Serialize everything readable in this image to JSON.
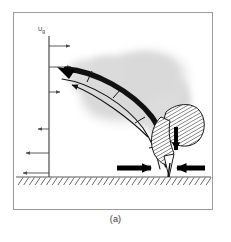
{
  "figure": {
    "caption": "(a)",
    "axis_label": "Ug",
    "axis_label_main": "U",
    "axis_label_sub": "g",
    "frame": {
      "x": 13,
      "y": 12,
      "width": 200,
      "height": 198,
      "border_color": "#9a9a9a"
    },
    "colors": {
      "background": "#ffffff",
      "frame_border": "#9a9a9a",
      "profile_line": "#4a4a4a",
      "profile_arrow": "#4a4a4a",
      "jet_band": "#111111",
      "plume": "#d4d4d4",
      "nozzle_hatch": "#1a1a1a",
      "nozzle_fill": "#ffffff",
      "ground_line": "#5a5a5a",
      "ground_hatch": "#5a5a5a",
      "bold_arrow": "#000000",
      "caption_text": "#3a3a3a"
    },
    "ground": {
      "y": 176,
      "x_start": 16,
      "x_end": 211,
      "hatch_count": 34,
      "hatch_length": 9,
      "hatch_angle_deg": 55
    },
    "velocity_profile": {
      "axis_x": 48,
      "axis_y_top": 35,
      "axis_y_bottom": 176,
      "label_x": 38,
      "label_y": 26,
      "arrows": [
        {
          "y": 45,
          "length": 22,
          "direction": "right"
        },
        {
          "y": 66,
          "length": 22,
          "direction": "right"
        },
        {
          "y": 91,
          "length": 12,
          "direction": "right"
        },
        {
          "y": 128,
          "length": 12,
          "direction": "left"
        },
        {
          "y": 152,
          "length": 24,
          "direction": "left"
        },
        {
          "y": 172,
          "length": 26,
          "direction": "left"
        }
      ]
    },
    "jet": {
      "description": "curved deflected jet band",
      "tip_x": 62,
      "tip_y": 66,
      "base_x": 160,
      "base_y": 168,
      "band_color": "#111111",
      "inner_arrow_direction": "up-left"
    },
    "plume": {
      "description": "fuzzy gray entrained plume cloud",
      "cx": 130,
      "cy": 82,
      "rx": 55,
      "ry": 36
    },
    "nozzle": {
      "description": "hatched burner nozzle bulb",
      "cx": 172,
      "cy": 125,
      "rx": 22,
      "ry": 20,
      "hatch_spacing": 3,
      "inner_arrow_direction": "down"
    },
    "ground_arrows": [
      {
        "x_start": 118,
        "x_end": 148,
        "y": 167,
        "direction": "right"
      },
      {
        "x_start": 203,
        "x_end": 172,
        "y": 167,
        "direction": "left"
      }
    ]
  }
}
